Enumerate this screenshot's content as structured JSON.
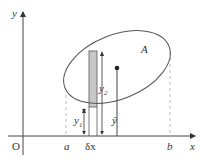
{
  "diagram": {
    "type": "area-centroid-figure",
    "region_label": "A",
    "axes": {
      "x_label": "x",
      "y_label": "y",
      "origin_label": "O"
    },
    "bounds": {
      "left_label": "a",
      "right_label": "b"
    },
    "strip": {
      "width_label": "δx",
      "fill_color": "#c8c8c8"
    },
    "measures": {
      "lower_label": "y",
      "lower_subscript": "1",
      "upper_label": "y",
      "upper_subscript": "2",
      "centroid_label": "ȳ"
    },
    "colors": {
      "line": "#555555",
      "dashed": "#aaaaaa",
      "background": "#ffffff"
    }
  }
}
